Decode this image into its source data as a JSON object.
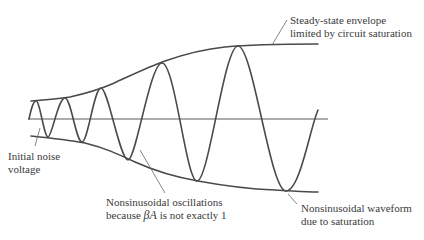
{
  "diagram": {
    "colors": {
      "background": "#ffffff",
      "curve": "#4a4a4a",
      "axis": "#5a5a5a",
      "text": "#3a3a3a"
    },
    "labels": {
      "steady_state": {
        "line1": "Steady-state envelope",
        "line2": "limited by circuit saturation"
      },
      "initial_noise": {
        "line1": "Initial noise",
        "line2": "voltage"
      },
      "nonsinusoidal_oscillations": {
        "line1": "Nonsinusoidal oscillations",
        "line2_pre": "because ",
        "line2_symbol": "βA",
        "line2_post": " is not exactly 1"
      },
      "nonsinusoidal_waveform": {
        "line1": "Nonsinusoidal waveform",
        "line2": "due to saturation"
      }
    },
    "elements": [
      "time axis (horizontal line)",
      "upper envelope curve (growing then leveling)",
      "lower envelope curve (growing then leveling)",
      "oscillating waveform with increasing amplitude and period spacing"
    ]
  }
}
